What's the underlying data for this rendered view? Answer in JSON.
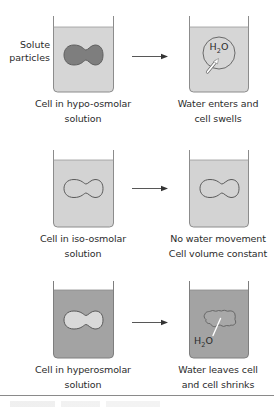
{
  "diagram": {
    "colors": {
      "beaker_outline": "#8c8c8c",
      "fluid_light": "#d6d6d6",
      "fluid_dark": "#a3a3a3",
      "cell_dark": "#7e7e7e",
      "cell_outline": "#5f5f5f",
      "cell_light": "#d9d9d9",
      "arrow": "#444444",
      "water_arrow": "#ffffff"
    },
    "side_label": {
      "line1": "Solute",
      "line2": "particles"
    },
    "rows": [
      {
        "left": {
          "condition": "hypo-osmolar",
          "label_line1": "Cell in hypo-osmolar",
          "label_line2": "solution"
        },
        "right": {
          "result": "swells",
          "label_line1": "Water enters and",
          "label_line2": "cell swells",
          "water_label": "H2O",
          "water_label_main": "H",
          "water_label_sub": "2",
          "water_label_tail": "O"
        }
      },
      {
        "left": {
          "condition": "iso-osmolar",
          "label_line1": "Cell in iso-osmolar",
          "label_line2": "solution"
        },
        "right": {
          "result": "constant",
          "label_line1": "No water movement",
          "label_line2": "Cell volume constant"
        }
      },
      {
        "left": {
          "condition": "hyperosmolar",
          "label_line1": "Cell in hyperosmolar",
          "label_line2": "solution"
        },
        "right": {
          "result": "shrinks",
          "label_line1": "Water leaves cell",
          "label_line2": "and cell shrinks",
          "water_label": "H2O",
          "water_label_main": "H",
          "water_label_sub": "2",
          "water_label_tail": "O"
        }
      }
    ]
  }
}
